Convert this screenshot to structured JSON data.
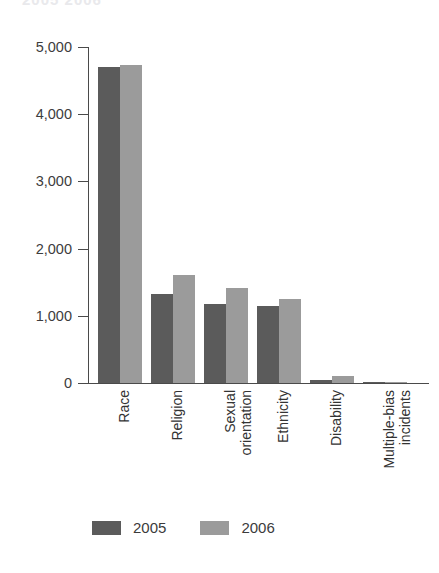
{
  "title_remnant": "2005 2006",
  "chart_data": {
    "type": "bar",
    "title": "",
    "subtitle": "",
    "xlabel": "",
    "ylabel": "",
    "ylim": [
      0,
      5000
    ],
    "yticks": [
      0,
      1000,
      2000,
      3000,
      4000,
      5000
    ],
    "ytick_labels": [
      "0",
      "1,000",
      "2,000",
      "3,000",
      "4,000",
      "5,000"
    ],
    "grid": false,
    "legend_position": "bottom-center",
    "categories": [
      "Race",
      "Religion",
      "Sexual orientation",
      "Ethnicity",
      "Disability",
      "Multiple-bias incidents"
    ],
    "category_lines": [
      [
        "Race"
      ],
      [
        "Religion"
      ],
      [
        "Sexual",
        "orientation"
      ],
      [
        "Ethnicity"
      ],
      [
        "Disability"
      ],
      [
        "Multiple-bias",
        "incidents"
      ]
    ],
    "series": [
      {
        "name": "2005",
        "color": "#5b5b5b",
        "values": [
          4700,
          1320,
          1170,
          1150,
          50,
          10
        ]
      },
      {
        "name": "2006",
        "color": "#9b9b9b",
        "values": [
          4730,
          1600,
          1420,
          1250,
          100,
          10
        ]
      }
    ]
  },
  "legend": {
    "items": [
      {
        "label": "2005",
        "color": "#5b5b5b"
      },
      {
        "label": "2006",
        "color": "#9b9b9b"
      }
    ]
  },
  "axis": {
    "axis_color": "#4a4a4a"
  }
}
